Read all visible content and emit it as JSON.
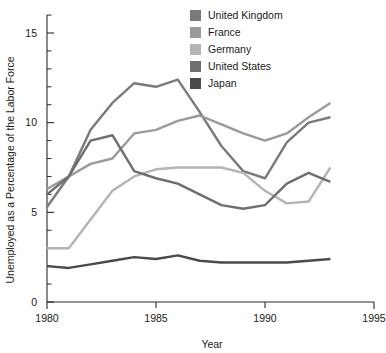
{
  "chart_data": {
    "type": "line",
    "title": "",
    "xlabel": "Year",
    "ylabel": "Unemployed as a Percentage of the Labor Force",
    "xlim": [
      1980,
      1995
    ],
    "ylim": [
      0,
      16
    ],
    "xticks": [
      1980,
      1985,
      1990,
      1995
    ],
    "yticks": [
      0,
      5,
      10,
      15
    ],
    "xtick_labels": [
      "1980",
      "1985",
      "1990",
      "1995"
    ],
    "ytick_labels": [
      "0",
      "5",
      "10",
      "15"
    ],
    "minor_tick_step": 1,
    "grid": false,
    "legend_position": "top-right",
    "x": [
      1980,
      1981,
      1982,
      1983,
      1984,
      1985,
      1986,
      1987,
      1988,
      1989,
      1990,
      1991,
      1992,
      1993
    ],
    "series": [
      {
        "name": "United Kingdom",
        "color": "#7a7a7a",
        "values": [
          5.3,
          7.0,
          9.6,
          11.1,
          12.2,
          12.0,
          12.4,
          10.6,
          8.7,
          7.3,
          6.9,
          8.9,
          10.0,
          10.3
        ]
      },
      {
        "name": "France",
        "color": "#9a9a9a",
        "values": [
          6.3,
          7.0,
          7.7,
          8.0,
          9.4,
          9.6,
          10.1,
          10.4,
          9.9,
          9.4,
          9.0,
          9.4,
          10.3,
          11.1
        ]
      },
      {
        "name": "Germany",
        "color": "#b4b4b4",
        "values": [
          3.0,
          3.0,
          4.6,
          6.2,
          7.0,
          7.4,
          7.5,
          7.5,
          7.5,
          7.2,
          6.2,
          5.5,
          5.6,
          7.5
        ]
      },
      {
        "name": "United States",
        "color": "#6e6e6e",
        "values": [
          6.0,
          7.0,
          9.0,
          9.3,
          7.3,
          6.9,
          6.6,
          6.0,
          5.4,
          5.2,
          5.4,
          6.6,
          7.2,
          6.7
        ]
      },
      {
        "name": "Japan",
        "color": "#4a4a4a",
        "values": [
          2.0,
          1.9,
          2.1,
          2.3,
          2.5,
          2.4,
          2.6,
          2.3,
          2.2,
          2.2,
          2.2,
          2.2,
          2.3,
          2.4
        ]
      }
    ]
  },
  "legend": {
    "items": [
      {
        "label": "United Kingdom",
        "color": "#7a7a7a"
      },
      {
        "label": "France",
        "color": "#9a9a9a"
      },
      {
        "label": "Germany",
        "color": "#b4b4b4"
      },
      {
        "label": "United States",
        "color": "#6e6e6e"
      },
      {
        "label": "Japan",
        "color": "#4a4a4a"
      }
    ]
  }
}
